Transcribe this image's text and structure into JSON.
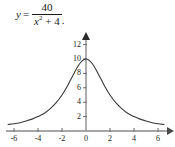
{
  "figure": {
    "equation": {
      "lhs": "y",
      "relation": "=",
      "numerator": "40",
      "denominator_base": "x",
      "denominator_exponent": "2",
      "denominator_rest": "+ 4",
      "trailing_mark": "."
    },
    "colors": {
      "curve": "#3a3a3a",
      "axis": "#8a8a8a",
      "text": "#1a1a1a",
      "background": "#ffffff"
    }
  },
  "chart_data": {
    "type": "line",
    "title": "",
    "subtitle": "",
    "xlabel": "",
    "ylabel": "",
    "function": "y = 40/(x^2 + 4)",
    "grid": false,
    "legend": null,
    "xlim": [
      -6.6,
      6.6
    ],
    "ylim": [
      0,
      13.2
    ],
    "xticks": [
      -6,
      -4,
      -2,
      0,
      2,
      4,
      6
    ],
    "xtick_labels": [
      "-6",
      "-4",
      "-2",
      "0",
      "2",
      "4",
      "6"
    ],
    "yticks": [
      2,
      4,
      6,
      8,
      10,
      12
    ],
    "ytick_labels": [
      "2",
      "4",
      "6",
      "8",
      "10",
      "12"
    ],
    "axis_arrows": [
      "x-right",
      "y-up"
    ],
    "series": [
      {
        "name": "y = 40/(x^2 + 4)",
        "color": "#3a3a3a",
        "x": [
          -6.5,
          -6.0,
          -5.5,
          -5.0,
          -4.5,
          -4.0,
          -3.5,
          -3.0,
          -2.5,
          -2.0,
          -1.5,
          -1.0,
          -0.5,
          0.0,
          0.5,
          1.0,
          1.5,
          2.0,
          2.5,
          3.0,
          3.5,
          4.0,
          4.5,
          5.0,
          5.5,
          6.0,
          6.5
        ],
        "y": [
          0.9,
          1.0,
          1.15,
          1.38,
          1.65,
          2.0,
          2.44,
          3.08,
          3.9,
          5.0,
          6.4,
          8.0,
          9.41,
          10.0,
          9.41,
          8.0,
          6.4,
          5.0,
          3.9,
          3.08,
          2.44,
          2.0,
          1.65,
          1.38,
          1.15,
          1.0,
          0.9
        ]
      }
    ]
  }
}
